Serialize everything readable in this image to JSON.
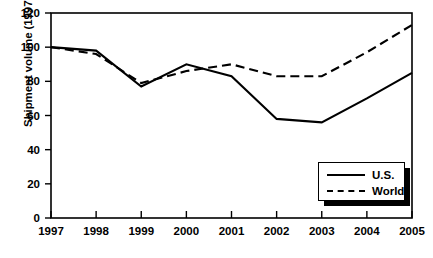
{
  "chart_data": {
    "type": "line",
    "title": "",
    "xlabel": "",
    "ylabel": "Shipment volume (1997 = 100)",
    "x": [
      1997,
      1998,
      1999,
      2000,
      2001,
      2002,
      2003,
      2004,
      2005
    ],
    "xtick_labels": [
      "1997",
      "1998",
      "1999",
      "2000",
      "2001",
      "2002",
      "2003",
      "2004",
      "2005"
    ],
    "ytick_labels": [
      "0",
      "20",
      "40",
      "60",
      "80",
      "100",
      "120"
    ],
    "yticks": [
      0,
      20,
      40,
      60,
      80,
      100,
      120
    ],
    "ylim": [
      0,
      120
    ],
    "xlim": [
      1997,
      2005
    ],
    "grid": false,
    "legend_position": "bottom-right",
    "series": [
      {
        "name": "U.S.",
        "style": "solid",
        "color": "#000000",
        "values": [
          100,
          98,
          77,
          90,
          83,
          58,
          56,
          70,
          85
        ]
      },
      {
        "name": "World",
        "style": "dashed",
        "color": "#000000",
        "values": [
          100,
          96,
          79,
          86,
          90,
          83,
          83,
          97,
          113
        ]
      }
    ]
  },
  "legend": {
    "items": [
      {
        "label": "U.S."
      },
      {
        "label": "World"
      }
    ]
  }
}
